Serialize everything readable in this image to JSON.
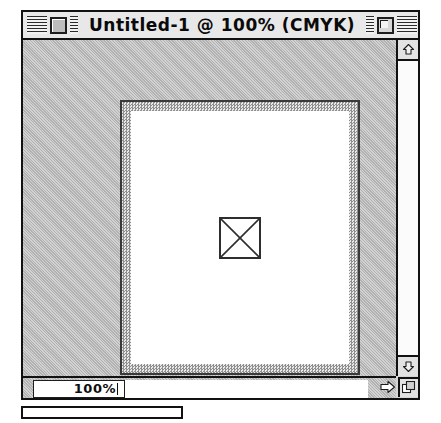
{
  "window": {
    "title": "Untitled-1 @ 100% (CMYK)",
    "document_name": "Untitled-1",
    "zoom_in_title": "100%",
    "color_mode": "CMYK",
    "close_box_icon": "close-box-icon",
    "zoom_box_icon": "zoom-box-icon",
    "stripe_pattern": "title-bar-stripes"
  },
  "canvas": {
    "placeholder_icon": "x-box-placeholder-icon",
    "page_background": "#ffffff",
    "frame_color": "#3a3a3a",
    "pasteboard_color": "#d2d2d2"
  },
  "scrollbars": {
    "vertical": {
      "up_arrow_icon": "scroll-up-arrow-icon",
      "down_arrow_icon": "scroll-down-arrow-icon",
      "track_state": "empty"
    },
    "horizontal": {
      "track_state": "empty"
    }
  },
  "status_bar": {
    "zoom_value": "100%",
    "zoom_field_has_caret": true,
    "size_arrow_icon": "size-right-arrow-icon",
    "grow_box_icon": "grow-box-icon"
  },
  "colors": {
    "title_bar_bg": "#e8e8e8",
    "window_border": "#111111",
    "text": "#0a0a0a",
    "pasteboard": "#d2d2d2",
    "canvas_white": "#ffffff"
  }
}
